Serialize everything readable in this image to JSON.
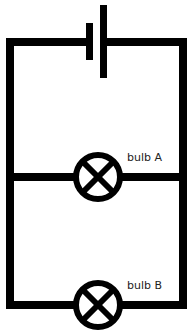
{
  "diagram": {
    "type": "circuit",
    "stroke_color": "#000000",
    "background": "#ffffff",
    "components": [
      {
        "id": "battery",
        "type": "cell"
      },
      {
        "id": "bulb_a",
        "type": "lamp",
        "label": "bulb A"
      },
      {
        "id": "bulb_b",
        "type": "lamp",
        "label": "bulb B"
      }
    ],
    "labels": {
      "bulb_a": "bulb A",
      "bulb_b": "bulb B"
    }
  }
}
